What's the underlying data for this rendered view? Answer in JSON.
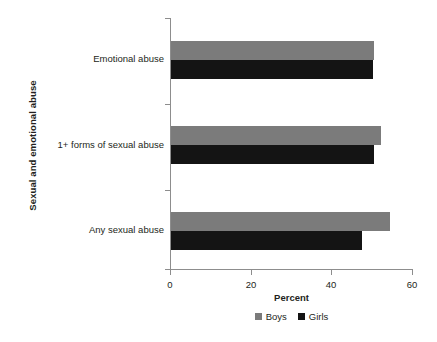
{
  "chart_data": {
    "type": "bar",
    "orientation": "horizontal",
    "title": "",
    "xlabel": "Percent",
    "ylabel": "Sexual and emotional abuse",
    "categories": [
      "Emotional abuse",
      "1+ forms of sexual abuse",
      "Any sexual abuse"
    ],
    "series": [
      {
        "name": "Boys",
        "color": "#7b7b7b",
        "values": [
          50.3,
          52.0,
          54.3
        ]
      },
      {
        "name": "Girls",
        "color": "#141414",
        "values": [
          50.2,
          50.3,
          47.4
        ]
      }
    ],
    "xlim": [
      0,
      60
    ],
    "xticks": [
      0,
      20,
      40,
      60
    ],
    "xtick_labels": [
      "0",
      "20",
      "40",
      "60"
    ],
    "grid": false,
    "legend_position": "bottom"
  },
  "axes": {
    "y_title": "Sexual and emotional abuse",
    "x_title": "Percent",
    "x_tick_labels": [
      "0",
      "20",
      "40",
      "60"
    ],
    "category_labels": [
      "Emotional abuse",
      "1+ forms of sexual abuse",
      "Any sexual abuse"
    ]
  },
  "legend": {
    "items": [
      {
        "label": "Boys",
        "color": "#7b7b7b"
      },
      {
        "label": "Girls",
        "color": "#141414"
      }
    ]
  }
}
